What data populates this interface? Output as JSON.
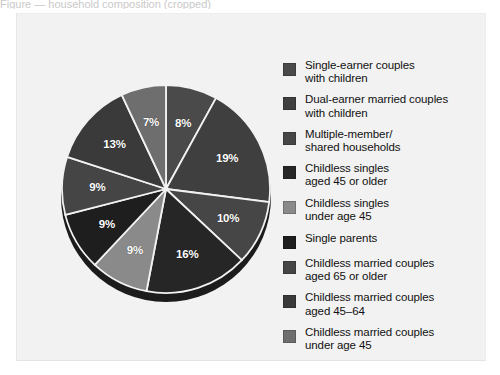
{
  "caption": {
    "cropped_text": "Figure — household composition (cropped)"
  },
  "chart_data": {
    "type": "pie",
    "title": "",
    "subtitle": "",
    "xlabel": "",
    "ylabel": "",
    "grid": false,
    "legend_position": "right",
    "units": "percent",
    "total": 100,
    "start_angle_deg": 0,
    "direction": "clockwise",
    "categories": [
      "Single-earner couples with children",
      "Dual-earner married couples with children",
      "Multiple-member/ shared households",
      "Childless singles aged 45 or older",
      "Childless singles under age 45",
      "Single parents",
      "Childless married couples aged 65 or older",
      "Childless married couples aged 45–64",
      "Childless married couples under age 45"
    ],
    "values": [
      8,
      19,
      10,
      16,
      9,
      9,
      9,
      13,
      7
    ],
    "labels": [
      "8%",
      "19%",
      "10%",
      "16%",
      "9%",
      "9%",
      "9%",
      "13%",
      "7%"
    ],
    "colors": [
      "#4a4a4a",
      "#3f3f3f",
      "#464646",
      "#262626",
      "#8a8a8a",
      "#1e1e1e",
      "#454545",
      "#3a3a3a",
      "#6e6e6e"
    ],
    "slice_separator_color": "#f2f2f2",
    "label_color": "#ffffff",
    "depth_color": "#1c1c1c"
  },
  "legend": {
    "items": [
      {
        "label": "Single-earner couples\nwith children",
        "color": "#4a4a4a",
        "value": 8
      },
      {
        "label": "Dual-earner married couples\nwith children",
        "color": "#3f3f3f",
        "value": 19
      },
      {
        "label": "Multiple-member/\nshared households",
        "color": "#464646",
        "value": 10
      },
      {
        "label": "Childless singles\naged 45 or older",
        "color": "#262626",
        "value": 16
      },
      {
        "label": "Childless singles\nunder age 45",
        "color": "#8a8a8a",
        "value": 9
      },
      {
        "label": "Single parents",
        "color": "#1e1e1e",
        "value": 9
      },
      {
        "label": "Childless married couples\naged 65 or older",
        "color": "#454545",
        "value": 9
      },
      {
        "label": "Childless married couples\naged 45–64",
        "color": "#3a3a3a",
        "value": 13
      },
      {
        "label": "Childless married couples\nunder age 45",
        "color": "#6e6e6e",
        "value": 7
      }
    ]
  },
  "panel": {
    "background": "#f2f2f2"
  }
}
